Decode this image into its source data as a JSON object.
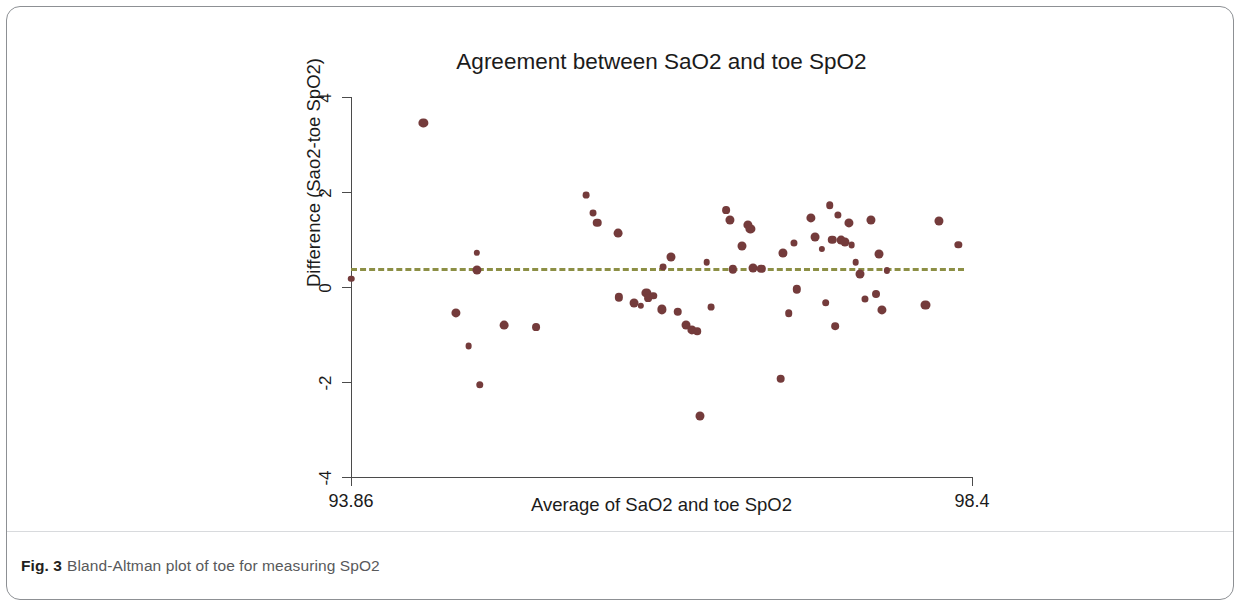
{
  "figure": {
    "caption_label": "Fig. 3",
    "caption_text": "Bland-Altman plot of toe for measuring SpO2"
  },
  "chart_data": {
    "type": "scatter",
    "title": "Agreement between SaO2 and toe SpO2",
    "xlabel": "Average of SaO2 and toe SpO2",
    "ylabel": "Difference (Sao2-toe SpO2)",
    "xlim": [
      93.86,
      98.4
    ],
    "ylim": [
      -4,
      4
    ],
    "xticks": [
      93.86,
      98.4
    ],
    "xticklabels": [
      "93.86",
      "98.4"
    ],
    "yticks": [
      4,
      2,
      0,
      -2,
      -4
    ],
    "yticklabels": [
      "4",
      "2",
      "0",
      "-2",
      "-4"
    ],
    "grid": false,
    "legend": null,
    "marker_color": "#743b3b",
    "annotations": [
      {
        "name": "bias-line",
        "type": "hline",
        "y": 0.39,
        "style": "dashed",
        "color": "#8c8f45"
      }
    ],
    "points": [
      {
        "x": 93.86,
        "y": 0.17
      },
      {
        "x": 94.39,
        "y": 3.45
      },
      {
        "x": 94.63,
        "y": -0.55
      },
      {
        "x": 94.72,
        "y": -1.25
      },
      {
        "x": 94.78,
        "y": 0.72
      },
      {
        "x": 94.78,
        "y": 0.35
      },
      {
        "x": 94.8,
        "y": -2.06
      },
      {
        "x": 94.98,
        "y": -0.8
      },
      {
        "x": 95.21,
        "y": -0.85
      },
      {
        "x": 95.58,
        "y": 1.93
      },
      {
        "x": 95.63,
        "y": 1.55
      },
      {
        "x": 95.66,
        "y": 1.35
      },
      {
        "x": 95.81,
        "y": 1.13
      },
      {
        "x": 95.82,
        "y": -0.22
      },
      {
        "x": 95.93,
        "y": -0.33
      },
      {
        "x": 95.98,
        "y": -0.4
      },
      {
        "x": 96.02,
        "y": -0.12
      },
      {
        "x": 96.03,
        "y": -0.23
      },
      {
        "x": 96.07,
        "y": -0.18
      },
      {
        "x": 96.13,
        "y": -0.47
      },
      {
        "x": 96.14,
        "y": 0.42
      },
      {
        "x": 96.2,
        "y": 0.63
      },
      {
        "x": 96.25,
        "y": -0.52
      },
      {
        "x": 96.31,
        "y": -0.8
      },
      {
        "x": 96.35,
        "y": -0.9
      },
      {
        "x": 96.39,
        "y": -0.93
      },
      {
        "x": 96.41,
        "y": -2.72
      },
      {
        "x": 96.46,
        "y": 0.52
      },
      {
        "x": 96.49,
        "y": -0.42
      },
      {
        "x": 96.6,
        "y": 1.62
      },
      {
        "x": 96.63,
        "y": 1.42
      },
      {
        "x": 96.65,
        "y": 0.37
      },
      {
        "x": 96.72,
        "y": 0.86
      },
      {
        "x": 96.76,
        "y": 1.3
      },
      {
        "x": 96.78,
        "y": 1.22
      },
      {
        "x": 96.8,
        "y": 0.4
      },
      {
        "x": 96.86,
        "y": 0.38
      },
      {
        "x": 97.0,
        "y": -1.93
      },
      {
        "x": 97.02,
        "y": 0.72
      },
      {
        "x": 97.06,
        "y": -0.55
      },
      {
        "x": 97.1,
        "y": 0.92
      },
      {
        "x": 97.12,
        "y": -0.05
      },
      {
        "x": 97.22,
        "y": 1.45
      },
      {
        "x": 97.25,
        "y": 1.05
      },
      {
        "x": 97.3,
        "y": 0.8
      },
      {
        "x": 97.33,
        "y": -0.33
      },
      {
        "x": 97.36,
        "y": 1.72
      },
      {
        "x": 97.38,
        "y": 1.0
      },
      {
        "x": 97.4,
        "y": -0.82
      },
      {
        "x": 97.42,
        "y": 1.52
      },
      {
        "x": 97.44,
        "y": 0.98
      },
      {
        "x": 97.47,
        "y": 0.95
      },
      {
        "x": 97.5,
        "y": 1.35
      },
      {
        "x": 97.52,
        "y": 0.88
      },
      {
        "x": 97.55,
        "y": 0.52
      },
      {
        "x": 97.58,
        "y": 0.28
      },
      {
        "x": 97.62,
        "y": -0.25
      },
      {
        "x": 97.66,
        "y": 1.42
      },
      {
        "x": 97.7,
        "y": -0.15
      },
      {
        "x": 97.72,
        "y": 0.7
      },
      {
        "x": 97.74,
        "y": -0.48
      },
      {
        "x": 97.78,
        "y": 0.35
      },
      {
        "x": 98.06,
        "y": -0.38
      },
      {
        "x": 98.16,
        "y": 1.4
      },
      {
        "x": 98.3,
        "y": 0.88
      }
    ]
  }
}
